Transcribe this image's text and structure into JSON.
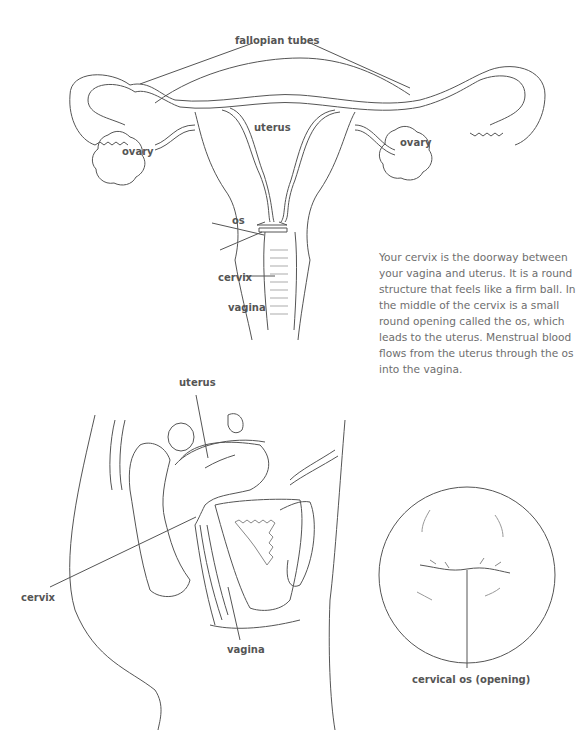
{
  "front_view": {
    "labels": {
      "fallopian_tubes": "fallopian tubes",
      "uterus": "uterus",
      "ovary_left": "ovary",
      "ovary_right": "ovary",
      "os": "os",
      "cervix": "cervix",
      "vagina": "vagina"
    }
  },
  "description": "Your cervix is the doorway between your vagina and uterus. It is a round structure that feels like a firm ball. In the middle of the cervix is a small round opening called the os, which leads to the uterus. Menstrual blood flows from the uterus through the os into the vagina.",
  "side_view": {
    "labels": {
      "uterus": "uterus",
      "cervix": "cervix",
      "vagina": "vagina"
    }
  },
  "cervix_view": {
    "labels": {
      "cervical_os": "cervical os (opening)"
    }
  },
  "colors": {
    "line": "#555555",
    "text": "#6e6e6e"
  }
}
